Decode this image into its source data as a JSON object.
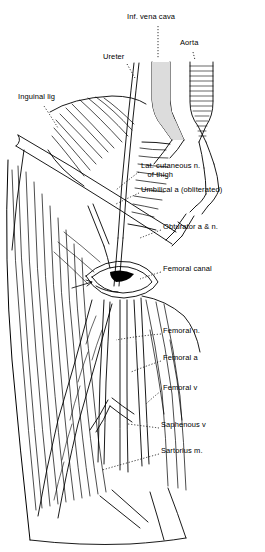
{
  "figure": {
    "type": "anatomical-illustration",
    "width": 265,
    "height": 552,
    "background_color": "#ffffff",
    "ink_color": "#000000",
    "shade_color": "#d8d8d8"
  },
  "labels": [
    {
      "id": "inf-vena-cava",
      "text": "Inf. vena cava",
      "x": 127,
      "y": 17,
      "align": "left"
    },
    {
      "id": "aorta",
      "text": "Aorta",
      "x": 180,
      "y": 43,
      "align": "left"
    },
    {
      "id": "ureter",
      "text": "Ureter",
      "x": 103,
      "y": 57,
      "align": "left"
    },
    {
      "id": "inguinal-lig",
      "text": "Inguinal lig",
      "x": 18,
      "y": 97,
      "align": "left"
    },
    {
      "id": "lat-cutaneous-n-of-thigh",
      "text": "Lat. cutaneous n.\n   of thigh",
      "x": 140,
      "y": 166,
      "align": "left"
    },
    {
      "id": "umbilical-a-obliterated",
      "text": "Umbilical a (obliterated)",
      "x": 140,
      "y": 189,
      "align": "left"
    },
    {
      "id": "obturator-a-and-n",
      "text": "Obturator a & n.",
      "x": 162,
      "y": 226,
      "align": "left"
    },
    {
      "id": "femoral-canal",
      "text": "Femoral canal",
      "x": 162,
      "y": 268,
      "align": "left"
    },
    {
      "id": "femoral-n",
      "text": "Femoral n.",
      "x": 162,
      "y": 330,
      "align": "left"
    },
    {
      "id": "femoral-a",
      "text": "Femoral a",
      "x": 162,
      "y": 357,
      "align": "left"
    },
    {
      "id": "femoral-v",
      "text": "Femoral v",
      "x": 162,
      "y": 387,
      "align": "left"
    },
    {
      "id": "saphenous-v",
      "text": "Saphenous v",
      "x": 160,
      "y": 424,
      "align": "left"
    },
    {
      "id": "sartorius-m",
      "text": "Sartorius m.",
      "x": 160,
      "y": 450,
      "align": "left"
    }
  ]
}
